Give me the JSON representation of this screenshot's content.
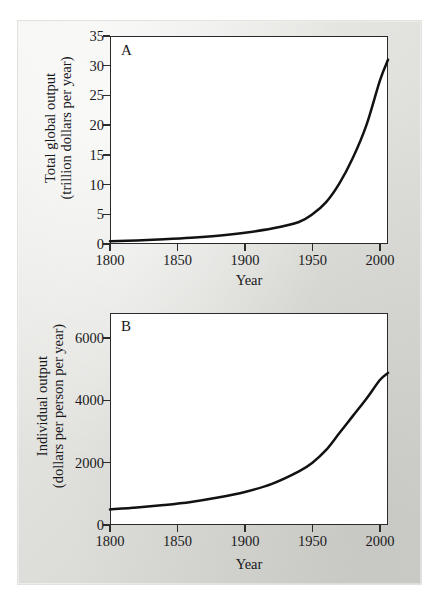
{
  "figure": {
    "background_color": "#e6e6e2",
    "plot_background_color": "#ffffff",
    "line_color": "#121212"
  },
  "panels": [
    {
      "letter": "A",
      "xlabel": "Year",
      "ylabel_line1": "Total global output",
      "ylabel_line2": "(trillion dollars per year)",
      "xticks": [
        "1800",
        "1850",
        "1900",
        "1950",
        "2000"
      ],
      "yticks": [
        "0",
        "5",
        "10",
        "15",
        "20",
        "25",
        "30",
        "35"
      ]
    },
    {
      "letter": "B",
      "xlabel": "Year",
      "ylabel_line1": "Individual output",
      "ylabel_line2": "(dollars per person per year)",
      "xticks": [
        "1800",
        "1850",
        "1900",
        "1950",
        "2000"
      ],
      "yticks": [
        "0",
        "2000",
        "4000",
        "6000"
      ]
    }
  ],
  "chart_data": [
    {
      "type": "line",
      "panel": "A",
      "title": "",
      "xlabel": "Year",
      "ylabel": "Total global output (trillion dollars per year)",
      "xlim": [
        1800,
        2006
      ],
      "ylim": [
        0,
        35
      ],
      "xticks": [
        1800,
        1850,
        1900,
        1950,
        2000
      ],
      "yticks": [
        0,
        5,
        10,
        15,
        20,
        25,
        30,
        35
      ],
      "grid": false,
      "legend": "none",
      "annotations": [
        "A"
      ],
      "x": [
        1800,
        1820,
        1840,
        1860,
        1880,
        1900,
        1920,
        1940,
        1950,
        1960,
        1970,
        1980,
        1990,
        2000,
        2006
      ],
      "values": [
        0.45,
        0.6,
        0.8,
        1.05,
        1.4,
        1.9,
        2.6,
        3.7,
        5.0,
        7.0,
        10.2,
        14.5,
        20.0,
        27.5,
        31.0
      ]
    },
    {
      "type": "line",
      "panel": "B",
      "title": "",
      "xlabel": "Year",
      "ylabel": "Individual output (dollars per person per year)",
      "xlim": [
        1800,
        2006
      ],
      "ylim": [
        0,
        6800
      ],
      "xticks": [
        1800,
        1850,
        1900,
        1950,
        2000
      ],
      "yticks": [
        0,
        2000,
        4000,
        6000
      ],
      "grid": false,
      "legend": "none",
      "annotations": [
        "B"
      ],
      "x": [
        1800,
        1820,
        1840,
        1860,
        1880,
        1900,
        1920,
        1940,
        1950,
        1960,
        1970,
        1980,
        1990,
        2000,
        2006
      ],
      "values": [
        500,
        560,
        640,
        740,
        880,
        1060,
        1320,
        1720,
        2000,
        2400,
        2950,
        3500,
        4050,
        4650,
        4880
      ]
    }
  ]
}
